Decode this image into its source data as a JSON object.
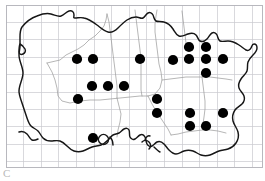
{
  "figure": {
    "type": "distribution-map",
    "title": "",
    "caption_fragment": "C",
    "background_color": "#ffffff",
    "grid_color": "#c9c9cf",
    "coast_color": "#1a1a1a",
    "internal_boundary_color": "#9a9a9a",
    "dot_color": "#000000",
    "dot_radius": 5.1
  },
  "grid": {
    "visible": true,
    "label": "10 km square grid",
    "x_start": 6,
    "x_step": 17.6,
    "x_count": 16,
    "y_start": 5,
    "y_step": 17.4,
    "y_count": 11,
    "frame": {
      "x": 6,
      "y": 5,
      "width": 256,
      "height": 162
    }
  },
  "chart_data": {
    "type": "scatter",
    "title": "",
    "xlabel": "",
    "ylabel": "",
    "xlim": [
      0,
      265
    ],
    "ylim": [
      0,
      181
    ],
    "grid": true,
    "legend": "none",
    "series": [
      {
        "name": "records",
        "marker": "filled-circle",
        "color": "#000000",
        "count": 27,
        "points": [
          {
            "x": 77,
            "y": 59
          },
          {
            "x": 93,
            "y": 59
          },
          {
            "x": 140,
            "y": 59
          },
          {
            "x": 173,
            "y": 60
          },
          {
            "x": 189,
            "y": 59
          },
          {
            "x": 206,
            "y": 59
          },
          {
            "x": 223,
            "y": 59
          },
          {
            "x": 189,
            "y": 47
          },
          {
            "x": 206,
            "y": 47
          },
          {
            "x": 206,
            "y": 73
          },
          {
            "x": 92,
            "y": 86
          },
          {
            "x": 108,
            "y": 86
          },
          {
            "x": 124,
            "y": 86
          },
          {
            "x": 78,
            "y": 99
          },
          {
            "x": 157,
            "y": 99
          },
          {
            "x": 157,
            "y": 113
          },
          {
            "x": 190,
            "y": 113
          },
          {
            "x": 223,
            "y": 113
          },
          {
            "x": 190,
            "y": 126
          },
          {
            "x": 206,
            "y": 126
          },
          {
            "x": 93,
            "y": 138
          }
        ]
      }
    ]
  },
  "map_regions": {
    "coastline_name": "southern-england-coastline",
    "boundaries_name": "county-boundaries"
  }
}
